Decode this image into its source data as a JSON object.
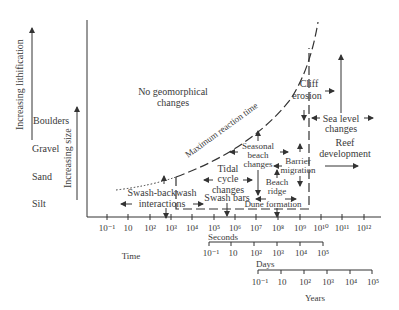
{
  "diagram": {
    "left_axis": {
      "lithification_label": "Increasing lithification",
      "size_label": "Increasing size",
      "size_classes": [
        "Boulders",
        "Gravel",
        "Sand",
        "Silt"
      ]
    },
    "regions": {
      "no_change_line1": "No geomorphical",
      "no_change_line2": "changes",
      "curve_label": "Maximum reaction time"
    },
    "processes": {
      "swash_line1": "Swash-backwash",
      "swash_line2": "interactions",
      "swash_bars": "Swash bars",
      "tidal_line1": "Tidal",
      "tidal_line2": "cycle",
      "tidal_line3": "changes",
      "seasonal_line1": "Seasonal",
      "seasonal_line2": "beach",
      "seasonal_line3": "changes",
      "beach_ridge_line1": "Beach",
      "beach_ridge_line2": "ridge",
      "barrier_line1": "Barrier",
      "barrier_line2": "migration",
      "dune": "Dune formation",
      "cliff_line1": "Cliff",
      "cliff_line2": "erosion",
      "sea_level_line1": "Sea level",
      "sea_level_line2": "changes",
      "reef_line1": "Reef",
      "reef_line2": "development"
    },
    "axes": {
      "time_label": "Time",
      "seconds_label": "Seconds",
      "days_label": "Days",
      "years_label": "Years",
      "seconds_ticks": [
        "10⁻¹",
        "10",
        "10²",
        "10³",
        "10⁴",
        "10⁵",
        "10⁶",
        "10⁷",
        "10⁸",
        "10⁹",
        "10¹⁰",
        "10¹¹",
        "10¹²"
      ],
      "days_ticks": [
        "10⁻¹",
        "10",
        "10²",
        "10³",
        "10⁴",
        "10⁵"
      ],
      "years_ticks": [
        "10⁻¹",
        "10",
        "10²",
        "10³",
        "10⁴",
        "10⁵"
      ]
    }
  }
}
